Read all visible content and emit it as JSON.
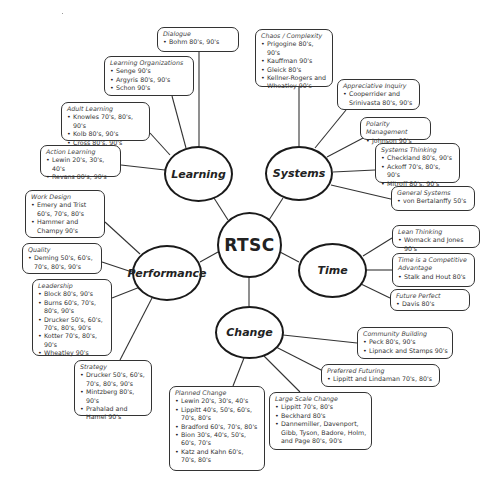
{
  "center": {
    "label": "RTSC"
  },
  "themes": {
    "learning": "Learning",
    "systems": "Systems",
    "performance": "Performance",
    "time": "Time",
    "change": "Change"
  },
  "boxes": {
    "dialogue": {
      "title": "Dialogue",
      "items": [
        "Bohm 80's, 90's"
      ]
    },
    "learning_orgs": {
      "title": "Learning Organizations",
      "items": [
        "Senge 90's",
        "Argyris 80's, 90's",
        "Schon 90's"
      ]
    },
    "adult_learning": {
      "title": "Adult Learning",
      "items": [
        "Knowles 70's, 80's, 90's",
        "Kolb 80's, 90's",
        "Cross 80's, 90's"
      ]
    },
    "action_learning": {
      "title": "Action Learning",
      "items": [
        "Lewin 20's, 30's, 40's",
        "Revans 80's, 90's"
      ]
    },
    "chaos": {
      "title": "Chaos / Complexity",
      "items": [
        "Prigogine 80's, 90's",
        "Kauffman 90's",
        "Gleick 80's",
        "Kellner-Rogers and Wheatley 90's"
      ]
    },
    "appreciative": {
      "title": "Appreciative Inquiry",
      "items": [
        "Cooperrider and Srinivasta 80's, 90's"
      ]
    },
    "polarity": {
      "title": "Polarity Management",
      "items": [
        "Johnson 90's"
      ]
    },
    "systems_thinking": {
      "title": "Systems Thinking",
      "items": [
        "Checkland 80's, 90's",
        "Ackoff 70's, 80's, 90's",
        "Mitroff 80's, 90's"
      ]
    },
    "general_systems": {
      "title": "General Systems",
      "items": [
        "von Bertalanffy 50's"
      ]
    },
    "work_design": {
      "title": "Work Design",
      "items": [
        "Emery and Trist 60's, 70's, 80's",
        "Hammer and Champy 90's"
      ]
    },
    "quality": {
      "title": "Quality",
      "items": [
        "Deming 50's, 60's, 70's, 80's, 90's"
      ]
    },
    "leadership": {
      "title": "Leadership",
      "items": [
        "Block 80's, 90's",
        "Burns 60's, 70's, 80's, 90's",
        "Drucker 50's, 60's, 70's, 80's, 90's",
        "Kotter 70's, 80's, 90's",
        "Wheatley 90's"
      ]
    },
    "strategy": {
      "title": "Strategy",
      "items": [
        "Drucker 50's, 60's, 70's, 80's, 90's",
        "Mintzberg 80's, 90's",
        "Prahalad and Hamel 90's"
      ]
    },
    "lean": {
      "title": "Lean Thinking",
      "items": [
        "Womack and Jones 90's"
      ]
    },
    "competitive": {
      "title": "Time is a Competitive Advantage",
      "items": [
        "Stalk and Hout 80's"
      ]
    },
    "future_perfect": {
      "title": "Future Perfect",
      "items": [
        "Davis 80's"
      ]
    },
    "community": {
      "title": "Community Building",
      "items": [
        "Peck 80's, 90's",
        "Lipnack and Stamps 90's"
      ]
    },
    "preferred": {
      "title": "Preferred Futuring",
      "items": [
        "Lippitt and Lindaman 70's, 80's"
      ]
    },
    "large_scale": {
      "title": "Large Scale Change",
      "items": [
        "Lippitt 70's, 80's",
        "Beckhard 80's",
        "Dannemiller, Davenport, Gibb, Tyson, Badore, Holm, and Page 80's, 90's"
      ]
    },
    "planned": {
      "title": "Planned Change",
      "items": [
        "Lewin 20's, 30's, 40's",
        "Lippitt 40's, 50's, 60's, 70's, 80's",
        "Bradford 60's, 70's, 80's",
        "Bion 30's, 40's, 50's, 60's, 70's",
        "Katz and Kahn 60's, 70's, 80's"
      ]
    }
  },
  "colors": {
    "line": "#333333",
    "node_border": "#1a1a1a",
    "background": "#ffffff"
  }
}
